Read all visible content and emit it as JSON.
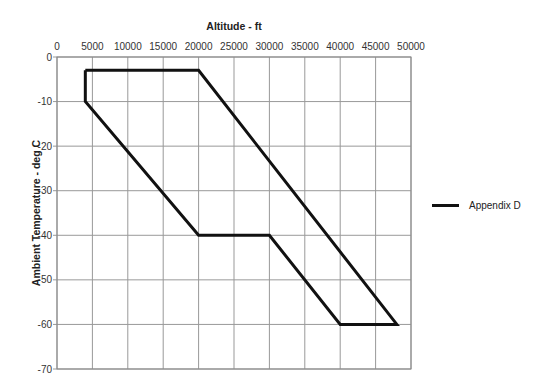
{
  "chart_data": {
    "type": "line",
    "title": "",
    "xlabel": "Altitude - ft",
    "ylabel": "Ambient Temperature - deg C",
    "x_ticks": [
      0,
      5000,
      10000,
      15000,
      20000,
      25000,
      30000,
      35000,
      40000,
      45000,
      50000
    ],
    "y_ticks": [
      0,
      -10,
      -20,
      -30,
      -40,
      -50,
      -60,
      -70
    ],
    "xlim": [
      0,
      50000
    ],
    "ylim": [
      -70,
      0
    ],
    "x_axis_position": "top",
    "grid": true,
    "legend_position": "right",
    "series": [
      {
        "name": "Appendix D",
        "color": "#111111",
        "closed": true,
        "x": [
          4000,
          20000,
          48000,
          40000,
          30000,
          20000,
          4000,
          4000
        ],
        "y": [
          -3,
          -3,
          -60,
          -60,
          -40,
          -40,
          -10,
          -3
        ]
      }
    ]
  },
  "legend": {
    "label": "Appendix D"
  }
}
